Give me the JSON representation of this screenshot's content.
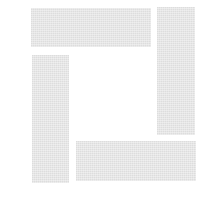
{
  "logo": {
    "name": "square-bars-logo",
    "color": "#e6e6e6",
    "background": "#ffffff",
    "bars": [
      {
        "id": "top",
        "x": 31,
        "y": 8,
        "w": 120,
        "h": 39
      },
      {
        "id": "right",
        "x": 157,
        "y": 7,
        "w": 38,
        "h": 128
      },
      {
        "id": "left",
        "x": 32,
        "y": 55,
        "w": 37,
        "h": 128
      },
      {
        "id": "bottom",
        "x": 76,
        "y": 141,
        "w": 120,
        "h": 40
      }
    ]
  }
}
